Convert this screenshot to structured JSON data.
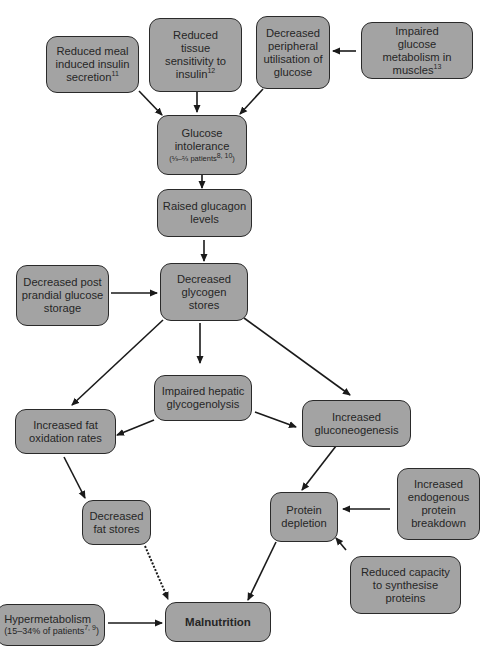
{
  "diagram": {
    "title": "",
    "colors": {
      "box_fill": "#a3a3a3",
      "box_border": "#2a2a2a",
      "text": "#262626",
      "arrow": "#1a1a1a"
    },
    "nodes": [
      {
        "id": "reduced_meal_insulin",
        "label": "Reduced meal induced insulin secretion",
        "ref": "11"
      },
      {
        "id": "reduced_tissue_sensitivity",
        "label": "Reduced tissue sensitivity to insulin",
        "ref": "12"
      },
      {
        "id": "decreased_peripheral_utilisation",
        "label": "Decreased peripheral utilisation of glucose",
        "ref": ""
      },
      {
        "id": "impaired_glucose_metabolism",
        "label": "Impaired glucose metabolism in muscles",
        "ref": "13"
      },
      {
        "id": "glucose_intolerance",
        "label": "Glucose intolerance",
        "sub_pre": "(⅓–⅔ patients",
        "sub_ref": "8, 10",
        "sub_post": ")"
      },
      {
        "id": "raised_glucagon",
        "label": "Raised glucagon levels"
      },
      {
        "id": "decreased_postprandial_storage",
        "label": "Decreased post prandial glucose storage"
      },
      {
        "id": "decreased_glycogen_stores",
        "label": "Decreased glycogen stores"
      },
      {
        "id": "impaired_hepatic_glycogenolysis",
        "label": "Impaired hepatic glycogenolysis"
      },
      {
        "id": "increased_fat_oxidation",
        "label": "Increased fat oxidation rates"
      },
      {
        "id": "increased_gluconeogenesis",
        "label": "Increased gluconeogenesis"
      },
      {
        "id": "decreased_fat_stores",
        "label": "Decreased fat stores"
      },
      {
        "id": "protein_depletion",
        "label": "Protein depletion"
      },
      {
        "id": "increased_protein_breakdown",
        "label": "Increased endogenous protein breakdown"
      },
      {
        "id": "reduced_protein_synthesis",
        "label": "Reduced capacity to synthesise proteins"
      },
      {
        "id": "hypermetabolism",
        "label": "Hypermetabolism",
        "sub_pre": "(15–34% of patients",
        "sub_ref": "7, 9",
        "sub_post": ")"
      },
      {
        "id": "malnutrition",
        "label": "Malnutrition"
      }
    ],
    "edges": [
      {
        "from": "reduced_meal_insulin",
        "to": "glucose_intolerance",
        "style": "solid"
      },
      {
        "from": "reduced_tissue_sensitivity",
        "to": "glucose_intolerance",
        "style": "solid"
      },
      {
        "from": "decreased_peripheral_utilisation",
        "to": "glucose_intolerance",
        "style": "solid"
      },
      {
        "from": "impaired_glucose_metabolism",
        "to": "decreased_peripheral_utilisation",
        "style": "solid"
      },
      {
        "from": "glucose_intolerance",
        "to": "raised_glucagon",
        "style": "solid"
      },
      {
        "from": "raised_glucagon",
        "to": "decreased_glycogen_stores",
        "style": "solid"
      },
      {
        "from": "decreased_postprandial_storage",
        "to": "decreased_glycogen_stores",
        "style": "solid"
      },
      {
        "from": "decreased_glycogen_stores",
        "to": "increased_fat_oxidation",
        "style": "solid"
      },
      {
        "from": "decreased_glycogen_stores",
        "to": "impaired_hepatic_glycogenolysis",
        "style": "solid"
      },
      {
        "from": "decreased_glycogen_stores",
        "to": "increased_gluconeogenesis",
        "style": "solid"
      },
      {
        "from": "impaired_hepatic_glycogenolysis",
        "to": "increased_fat_oxidation",
        "style": "solid"
      },
      {
        "from": "impaired_hepatic_glycogenolysis",
        "to": "increased_gluconeogenesis",
        "style": "solid"
      },
      {
        "from": "increased_fat_oxidation",
        "to": "decreased_fat_stores",
        "style": "solid"
      },
      {
        "from": "increased_gluconeogenesis",
        "to": "protein_depletion",
        "style": "solid"
      },
      {
        "from": "increased_protein_breakdown",
        "to": "protein_depletion",
        "style": "solid"
      },
      {
        "from": "reduced_protein_synthesis",
        "to": "protein_depletion",
        "style": "solid"
      },
      {
        "from": "decreased_fat_stores",
        "to": "malnutrition",
        "style": "dotted"
      },
      {
        "from": "protein_depletion",
        "to": "malnutrition",
        "style": "solid"
      },
      {
        "from": "hypermetabolism",
        "to": "malnutrition",
        "style": "solid"
      }
    ]
  }
}
